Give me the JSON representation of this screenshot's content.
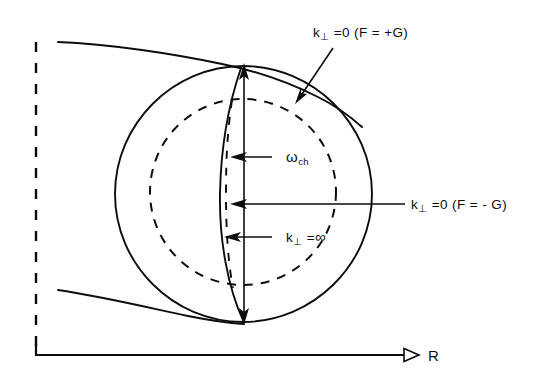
{
  "figure": {
    "kind": "physics-schematic-diagram",
    "background_color": "#ffffff",
    "ink_color": "#0d0d0d"
  },
  "axes": {
    "horizontal": {
      "label": "R",
      "name": "major-radius-axis",
      "style": "solid-with-arrowhead",
      "x_start": 36,
      "x_end": 412,
      "y": 355
    },
    "vertical": {
      "label": "",
      "name": "vertical-axis",
      "style": "dashed",
      "x": 36,
      "y_start": 42,
      "y_end": 355
    }
  },
  "labels": {
    "top_annotation": {
      "k": "k",
      "perp": "⊥",
      "rest": " =0 (F = +G)",
      "full": "k⊥ =0 (F = +G)"
    },
    "right_annotation": {
      "k": "k",
      "perp": "⊥",
      "rest": " =0 (F = - G)",
      "full": "k⊥ =0 (F = - G)"
    },
    "omega_annotation": {
      "omega": "ω",
      "sub": "ch",
      "full": "ωch"
    },
    "k_infinity_annotation": {
      "k": "k",
      "perp": "⊥",
      "rest": " =",
      "infinity": "∞",
      "full": "k⊥ =∞"
    },
    "axis_r": "R"
  },
  "shapes": {
    "outer_circle": {
      "name": "plasma-boundary-circle",
      "cx": 243,
      "cy": 194,
      "r": 128,
      "style": "solid"
    },
    "inner_circle": {
      "name": "resonance-surface-circle",
      "cx": 243,
      "cy": 192,
      "r": 93,
      "style": "dashed"
    },
    "vertical_chord": {
      "name": "vertical-chord-line",
      "x": 244,
      "y_top": 67,
      "y_bottom": 322,
      "style": "solid"
    },
    "dashed_chord": {
      "name": "dashed-inner-chord",
      "x": 231,
      "y_top": 100,
      "y_bottom": 288,
      "style": "dashed"
    },
    "lens_curve": {
      "name": "cutoff-curve",
      "style": "solid-bowed-left"
    },
    "upper_tangent_curve": {
      "name": "upper-ray-trajectory",
      "style": "solid"
    },
    "lower_tangent_curve": {
      "name": "lower-ray-trajectory",
      "style": "solid"
    },
    "double_arrow": {
      "name": "vertical-double-arrow",
      "style": "both-ends-filled-arrowheads"
    }
  }
}
